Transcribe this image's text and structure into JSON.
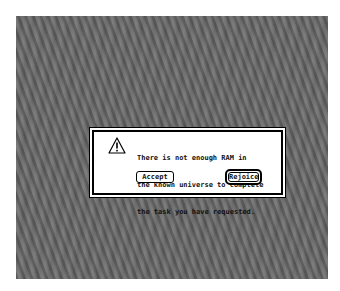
{
  "alert": {
    "icon": "caution-icon",
    "message_lines": [
      "There is not enough RAM in",
      "the known universe to complete",
      "the task you have requested."
    ],
    "buttons": {
      "accept_label": "Accept",
      "rejoice_label": "Rejoice",
      "default_button": "Rejoice"
    }
  }
}
